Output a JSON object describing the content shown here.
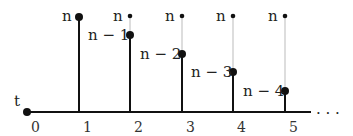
{
  "diagram": {
    "origin_label": "t",
    "axis_ticks": [
      "0",
      "1",
      "2",
      "3",
      "4",
      "5"
    ],
    "continuation": ". . .",
    "stems": [
      {
        "x": 79,
        "tick": "1",
        "top_label": "n",
        "value_label": null,
        "value_y": 17
      },
      {
        "x": 130,
        "tick": "2",
        "top_label": "n",
        "value_label": "n − 1",
        "value_y": 35
      },
      {
        "x": 182,
        "tick": "3",
        "top_label": "n",
        "value_label": "n − 2",
        "value_y": 54
      },
      {
        "x": 233,
        "tick": "4",
        "top_label": "n",
        "value_label": "n − 3",
        "value_y": 72
      },
      {
        "x": 285,
        "tick": "5",
        "top_label": "n",
        "value_label": "n − 4",
        "value_y": 91
      }
    ],
    "colors": {
      "stroke": "#111111",
      "guide": "#bbbbbb",
      "text": "#222222"
    }
  }
}
